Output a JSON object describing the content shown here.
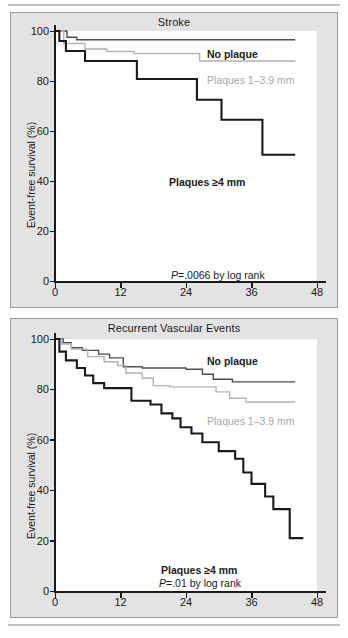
{
  "figure": {
    "background": "#ffffff",
    "panel_background": "#e3e3e3",
    "plot_background": "#ffffff"
  },
  "colors": {
    "no_plaque": "#4d4d4d",
    "plaques_small": "#b3b3b3",
    "plaques_large": "#1a1a1a",
    "axis": "#1a1a1a",
    "text": "#1a1a1a",
    "gray_text": "#a8a8a8"
  },
  "panels": [
    {
      "title": "Stroke",
      "ylabel": "Event-free survival (%)",
      "yticks": [
        "0",
        "20",
        "40",
        "60",
        "80",
        "100"
      ],
      "xticks": [
        "0",
        "12",
        "24",
        "36",
        "48"
      ],
      "pvalue": "=.0066 by log rank",
      "pvalue_prefix": "P",
      "labels": {
        "no_plaque": "No plaque",
        "plaques_small": "Plaques 1–3.9 mm",
        "plaques_large": "Plaques ≥4 mm"
      }
    },
    {
      "title": "Recurrent Vascular Events",
      "ylabel": "Event-free survival (%)",
      "yticks": [
        "0",
        "20",
        "40",
        "60",
        "80",
        "100"
      ],
      "xticks": [
        "0",
        "12",
        "24",
        "36",
        "48"
      ],
      "pvalue": "=.01 by log rank",
      "pvalue_prefix": "P",
      "labels": {
        "no_plaque": "No plaque",
        "plaques_small": "Plaques 1–3.9 mm",
        "plaques_large": "Plaques ≥4 mm"
      }
    }
  ],
  "chart_data": [
    {
      "type": "line",
      "title": "Stroke",
      "xlabel": "",
      "ylabel": "Event-free survival (%)",
      "xlim": [
        0,
        48
      ],
      "ylim": [
        0,
        100
      ],
      "xticks": [
        0,
        12,
        24,
        36,
        48
      ],
      "yticks": [
        0,
        20,
        40,
        60,
        80,
        100
      ],
      "grid": false,
      "legend": "inline-annotations",
      "annotations": [
        "No plaque",
        "Plaques 1–3.9 mm",
        "Plaques ≥4 mm",
        "P=.0066 by log rank"
      ],
      "series": [
        {
          "name": "No plaque",
          "style": "step",
          "color": "#4d4d4d",
          "points": [
            [
              0,
              100
            ],
            [
              2.2,
              100
            ],
            [
              2.2,
              97.5
            ],
            [
              4.0,
              97.5
            ],
            [
              4.0,
              96.5
            ],
            [
              44.0,
              96.5
            ]
          ]
        },
        {
          "name": "Plaques 1–3.9 mm",
          "style": "step",
          "color": "#b3b3b3",
          "points": [
            [
              0,
              100
            ],
            [
              1.6,
              100
            ],
            [
              1.6,
              95.0
            ],
            [
              5.5,
              95.0
            ],
            [
              5.5,
              92.8
            ],
            [
              9.5,
              92.8
            ],
            [
              9.5,
              91.8
            ],
            [
              14.5,
              91.8
            ],
            [
              14.5,
              91.0
            ],
            [
              26.5,
              91.0
            ],
            [
              26.5,
              88.0
            ],
            [
              44.0,
              88.0
            ]
          ]
        },
        {
          "name": "Plaques ≥4 mm",
          "style": "step",
          "color": "#1a1a1a",
          "points": [
            [
              0,
              100
            ],
            [
              0.8,
              100
            ],
            [
              0.8,
              96.0
            ],
            [
              2.0,
              96.0
            ],
            [
              2.0,
              92.0
            ],
            [
              5.5,
              92.0
            ],
            [
              5.5,
              88.0
            ],
            [
              15.0,
              88.0
            ],
            [
              15.0,
              80.8
            ],
            [
              26.0,
              80.8
            ],
            [
              26.0,
              72.5
            ],
            [
              30.5,
              72.5
            ],
            [
              30.5,
              64.5
            ],
            [
              38.0,
              64.5
            ],
            [
              38.0,
              50.5
            ],
            [
              44.0,
              50.5
            ]
          ]
        }
      ]
    },
    {
      "type": "line",
      "title": "Recurrent Vascular Events",
      "xlabel": "",
      "ylabel": "Event-free survival (%)",
      "xlim": [
        0,
        48
      ],
      "ylim": [
        0,
        100
      ],
      "xticks": [
        0,
        12,
        24,
        36,
        48
      ],
      "yticks": [
        0,
        20,
        40,
        60,
        80,
        100
      ],
      "grid": false,
      "legend": "inline-annotations",
      "annotations": [
        "No plaque",
        "Plaques 1–3.9 mm",
        "Plaques ≥4 mm",
        "P=.01 by log rank"
      ],
      "series": [
        {
          "name": "No plaque",
          "style": "step",
          "color": "#4d4d4d",
          "points": [
            [
              0,
              100
            ],
            [
              1.5,
              100
            ],
            [
              1.5,
              98.5
            ],
            [
              3.0,
              98.5
            ],
            [
              3.0,
              96.5
            ],
            [
              5.0,
              96.5
            ],
            [
              5.0,
              95.5
            ],
            [
              8.0,
              95.5
            ],
            [
              8.0,
              94.0
            ],
            [
              10.0,
              94.0
            ],
            [
              10.0,
              92.5
            ],
            [
              12.5,
              92.5
            ],
            [
              12.5,
              89.0
            ],
            [
              16.0,
              89.0
            ],
            [
              16.0,
              88.5
            ],
            [
              24.0,
              88.5
            ],
            [
              24.0,
              88.0
            ],
            [
              27.0,
              88.0
            ],
            [
              27.0,
              86.0
            ],
            [
              29.0,
              86.0
            ],
            [
              29.0,
              84.0
            ],
            [
              32.5,
              84.0
            ],
            [
              32.5,
              83.0
            ],
            [
              44.0,
              83.0
            ]
          ]
        },
        {
          "name": "Plaques 1–3.9 mm",
          "style": "step",
          "color": "#b3b3b3",
          "points": [
            [
              0,
              100
            ],
            [
              1.2,
              100
            ],
            [
              1.2,
              98.0
            ],
            [
              3.0,
              98.0
            ],
            [
              3.0,
              96.0
            ],
            [
              6.0,
              96.0
            ],
            [
              6.0,
              93.0
            ],
            [
              9.0,
              93.0
            ],
            [
              9.0,
              91.0
            ],
            [
              11.5,
              91.0
            ],
            [
              11.5,
              89.5
            ],
            [
              13.0,
              89.5
            ],
            [
              13.0,
              86.5
            ],
            [
              16.0,
              86.5
            ],
            [
              16.0,
              84.5
            ],
            [
              18.0,
              84.5
            ],
            [
              18.0,
              81.5
            ],
            [
              21.0,
              81.5
            ],
            [
              21.0,
              81.0
            ],
            [
              29.5,
              81.0
            ],
            [
              29.5,
              79.0
            ],
            [
              32.0,
              79.0
            ],
            [
              32.0,
              76.5
            ],
            [
              35.0,
              76.5
            ],
            [
              35.0,
              75.0
            ],
            [
              44.0,
              75.0
            ]
          ]
        },
        {
          "name": "Plaques ≥4 mm",
          "style": "step",
          "color": "#1a1a1a",
          "points": [
            [
              0,
              100
            ],
            [
              0.8,
              100
            ],
            [
              0.8,
              95.0
            ],
            [
              2.0,
              95.0
            ],
            [
              2.0,
              91.5
            ],
            [
              4.0,
              91.5
            ],
            [
              4.0,
              88.5
            ],
            [
              5.5,
              88.5
            ],
            [
              5.5,
              85.5
            ],
            [
              7.0,
              85.5
            ],
            [
              7.0,
              82.5
            ],
            [
              9.0,
              82.5
            ],
            [
              9.0,
              80.5
            ],
            [
              14.0,
              80.5
            ],
            [
              14.0,
              75.5
            ],
            [
              17.5,
              75.5
            ],
            [
              17.5,
              74.0
            ],
            [
              19.5,
              74.0
            ],
            [
              19.5,
              70.5
            ],
            [
              21.5,
              70.5
            ],
            [
              21.5,
              68.5
            ],
            [
              23.0,
              68.5
            ],
            [
              23.0,
              65.0
            ],
            [
              25.0,
              65.0
            ],
            [
              25.0,
              62.5
            ],
            [
              27.0,
              62.5
            ],
            [
              27.0,
              59.0
            ],
            [
              30.0,
              59.0
            ],
            [
              30.0,
              55.5
            ],
            [
              33.0,
              55.5
            ],
            [
              33.0,
              52.5
            ],
            [
              34.5,
              52.5
            ],
            [
              34.5,
              47.0
            ],
            [
              36.0,
              47.0
            ],
            [
              36.0,
              42.5
            ],
            [
              38.5,
              42.5
            ],
            [
              38.5,
              37.5
            ],
            [
              40.0,
              37.5
            ],
            [
              40.0,
              32.5
            ],
            [
              43.0,
              32.5
            ],
            [
              43.0,
              21.0
            ],
            [
              45.5,
              21.0
            ]
          ]
        }
      ]
    }
  ]
}
